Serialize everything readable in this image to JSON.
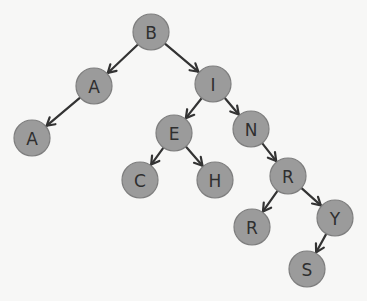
{
  "diagram": {
    "type": "binary-tree",
    "colors": {
      "background": "#f7f7f6",
      "node_fill": "#9b9b9b",
      "node_stroke": "#7e7e7e",
      "edge": "#333333",
      "label": "#2f2f2f"
    },
    "node_radius": 18,
    "nodes": [
      {
        "id": "n_B",
        "label": "B",
        "x": 151,
        "y": 32
      },
      {
        "id": "n_A1",
        "label": "A",
        "x": 94,
        "y": 86
      },
      {
        "id": "n_I",
        "label": "I",
        "x": 213,
        "y": 84
      },
      {
        "id": "n_A2",
        "label": "A",
        "x": 32,
        "y": 138
      },
      {
        "id": "n_E",
        "label": "E",
        "x": 174,
        "y": 133
      },
      {
        "id": "n_N",
        "label": "N",
        "x": 251,
        "y": 129
      },
      {
        "id": "n_C",
        "label": "C",
        "x": 140,
        "y": 180
      },
      {
        "id": "n_H",
        "label": "H",
        "x": 215,
        "y": 180
      },
      {
        "id": "n_R1",
        "label": "R",
        "x": 288,
        "y": 176
      },
      {
        "id": "n_R2",
        "label": "R",
        "x": 252,
        "y": 227
      },
      {
        "id": "n_Y",
        "label": "Y",
        "x": 335,
        "y": 218
      },
      {
        "id": "n_S",
        "label": "S",
        "x": 307,
        "y": 269
      }
    ],
    "edges": [
      {
        "from": "n_B",
        "to": "n_A1"
      },
      {
        "from": "n_B",
        "to": "n_I"
      },
      {
        "from": "n_A1",
        "to": "n_A2"
      },
      {
        "from": "n_I",
        "to": "n_E"
      },
      {
        "from": "n_I",
        "to": "n_N"
      },
      {
        "from": "n_E",
        "to": "n_C"
      },
      {
        "from": "n_E",
        "to": "n_H"
      },
      {
        "from": "n_N",
        "to": "n_R1"
      },
      {
        "from": "n_R1",
        "to": "n_R2"
      },
      {
        "from": "n_R1",
        "to": "n_Y"
      },
      {
        "from": "n_Y",
        "to": "n_S"
      }
    ]
  }
}
